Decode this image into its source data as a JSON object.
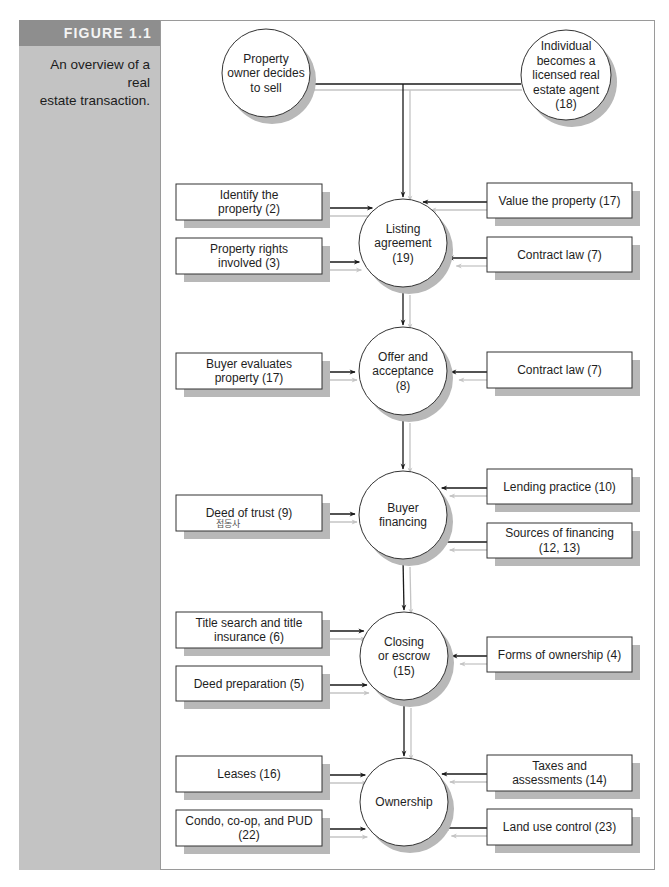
{
  "figure": {
    "label": "FIGURE 1.1",
    "caption_lines": [
      "An overview of a real",
      "estate transaction."
    ]
  },
  "colors": {
    "sidebar": "#c3c3c3",
    "header": "#8e8e8e",
    "shadow": "#b8b8b8",
    "line_dark": "#1a1a1a",
    "line_light": "#c4c4c4"
  },
  "diagram": {
    "start_nodes": [
      {
        "id": "owner",
        "lines": [
          "Property",
          "owner decides",
          "to sell"
        ],
        "cx": 266,
        "cy": 73,
        "r": 44
      },
      {
        "id": "agent",
        "lines": [
          "Individual",
          "becomes a",
          "licensed real",
          "estate agent",
          "(18)"
        ],
        "cx": 566,
        "cy": 75,
        "r": 45
      }
    ],
    "stages": [
      {
        "id": "listing",
        "lines": [
          "Listing",
          "agreement",
          "(19)"
        ],
        "cx": 403,
        "cy": 243,
        "r": 44,
        "left": [
          {
            "lines": [
              "Identify the",
              "property (2)"
            ],
            "y": 184,
            "h": 36,
            "ay": 208
          },
          {
            "lines": [
              "Property rights",
              "involved (3)"
            ],
            "y": 238,
            "h": 36,
            "ay": 262
          }
        ],
        "right": [
          {
            "lines": [
              "Value the property (17)"
            ],
            "y": 183,
            "h": 35,
            "ay": 202
          },
          {
            "lines": [
              "Contract law (7)"
            ],
            "y": 237,
            "h": 35,
            "ay": 258
          }
        ]
      },
      {
        "id": "offer",
        "lines": [
          "Offer and",
          "acceptance",
          "(8)"
        ],
        "cx": 403,
        "cy": 371,
        "r": 44,
        "left": [
          {
            "lines": [
              "Buyer evaluates",
              "property (17)"
            ],
            "y": 353,
            "h": 36,
            "ay": 372
          }
        ],
        "right": [
          {
            "lines": [
              "Contract law (7)"
            ],
            "y": 352,
            "h": 36,
            "ay": 372
          }
        ]
      },
      {
        "id": "financing",
        "lines": [
          "Buyer",
          "financing"
        ],
        "cx": 403,
        "cy": 515,
        "r": 44,
        "left": [
          {
            "lines": [
              "Deed of trust (9)"
            ],
            "y": 495,
            "h": 36,
            "ay": 514,
            "annotation": "접동사"
          }
        ],
        "right": [
          {
            "lines": [
              "Lending practice (10)"
            ],
            "y": 469,
            "h": 35,
            "ay": 488
          },
          {
            "lines": [
              "Sources of financing",
              "(12, 13)"
            ],
            "y": 523,
            "h": 35,
            "ay": 542
          }
        ]
      },
      {
        "id": "closing",
        "lines": [
          "Closing",
          "or escrow",
          "(15)"
        ],
        "cx": 404,
        "cy": 656,
        "r": 44,
        "left": [
          {
            "lines": [
              "Title search and title",
              "insurance (6)"
            ],
            "y": 612,
            "h": 36,
            "ay": 631
          },
          {
            "lines": [
              "Deed preparation (5)"
            ],
            "y": 666,
            "h": 35,
            "ay": 685
          }
        ],
        "right": [
          {
            "lines": [
              "Forms of ownership (4)"
            ],
            "y": 637,
            "h": 35,
            "ay": 656
          }
        ]
      },
      {
        "id": "ownership",
        "lines": [
          "Ownership"
        ],
        "cx": 404,
        "cy": 802,
        "r": 44,
        "left": [
          {
            "lines": [
              "Leases (16)"
            ],
            "y": 756,
            "h": 36,
            "ay": 775
          },
          {
            "lines": [
              "Condo, co-op, and PUD",
              "(22)"
            ],
            "y": 810,
            "h": 36,
            "ay": 829
          }
        ],
        "right": [
          {
            "lines": [
              "Taxes and",
              "assessments (14)"
            ],
            "y": 755,
            "h": 36,
            "ay": 774
          },
          {
            "lines": [
              "Land use control (23)"
            ],
            "y": 809,
            "h": 36,
            "ay": 828
          }
        ]
      }
    ]
  }
}
